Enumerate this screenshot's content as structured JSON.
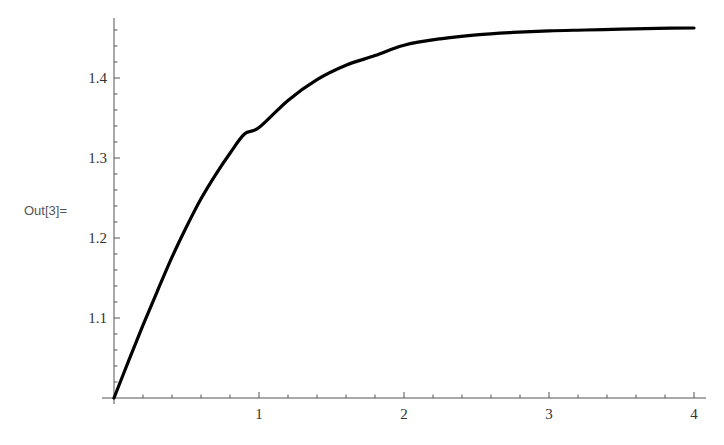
{
  "cell": {
    "output_label": "Out[3]="
  },
  "colors": {
    "axis": "#555555",
    "curve": "#000000",
    "text": "#333333",
    "background": "#ffffff"
  },
  "chart_data": {
    "type": "line",
    "title": "",
    "xlabel": "",
    "ylabel": "",
    "xlim": [
      0,
      4
    ],
    "ylim": [
      1.0,
      1.475
    ],
    "grid": false,
    "legend": null,
    "x_ticks": [
      1,
      2,
      3,
      4
    ],
    "x_tick_labels": [
      "1",
      "2",
      "3",
      "4"
    ],
    "y_ticks": [
      1.1,
      1.2,
      1.3,
      1.4
    ],
    "y_tick_labels": [
      "1.1",
      "1.2",
      "1.3",
      "1.4"
    ],
    "series": [
      {
        "name": "curve",
        "x": [
          0,
          0.1,
          0.2,
          0.3,
          0.4,
          0.5,
          0.6,
          0.7,
          0.8,
          0.9,
          1.0,
          1.2,
          1.4,
          1.6,
          1.8,
          2.0,
          2.25,
          2.5,
          2.75,
          3.0,
          3.25,
          3.5,
          3.75,
          4.0
        ],
        "values": [
          1.0,
          1.046,
          1.091,
          1.134,
          1.176,
          1.214,
          1.249,
          1.279,
          1.306,
          1.33,
          1.338,
          1.372,
          1.398,
          1.416,
          1.428,
          1.441,
          1.449,
          1.454,
          1.457,
          1.459,
          1.46,
          1.461,
          1.462,
          1.4625
        ]
      }
    ]
  }
}
